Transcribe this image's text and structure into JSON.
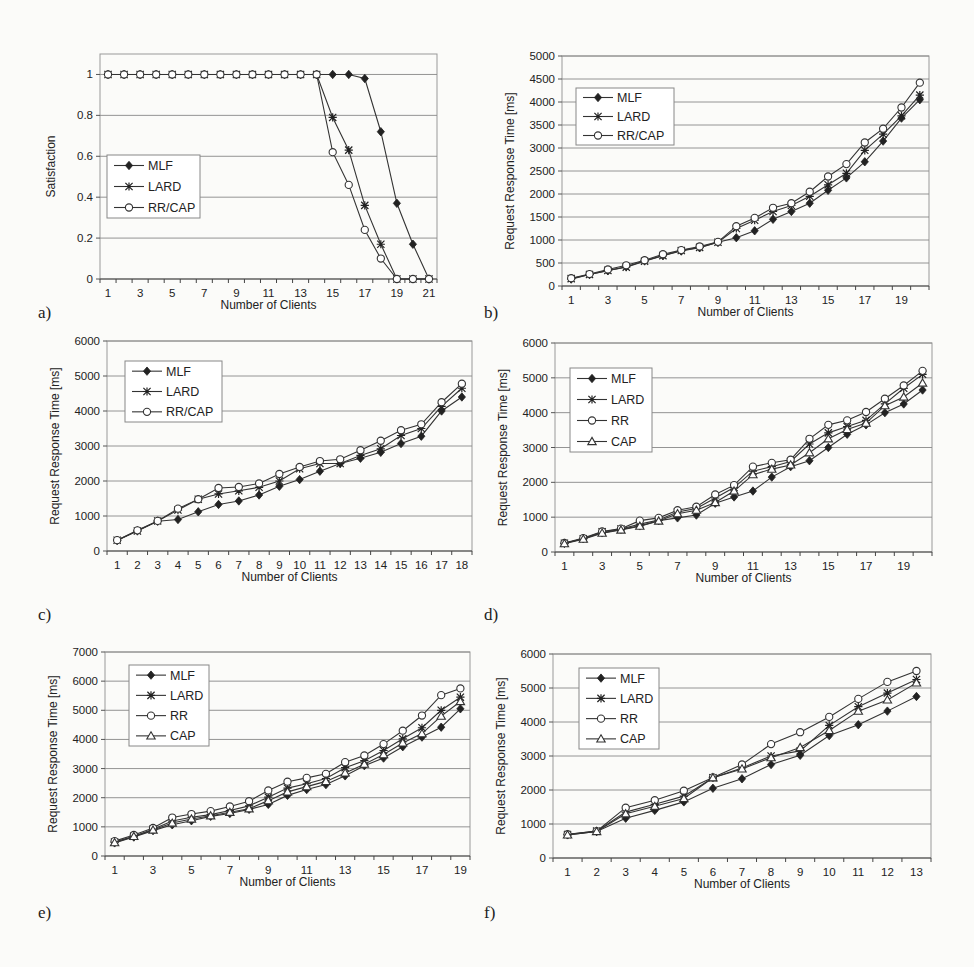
{
  "figure": {
    "panel_labels": [
      "a)",
      "b)",
      "c)",
      "d)",
      "e)",
      "f)"
    ]
  },
  "chart_data": [
    {
      "id": "a",
      "type": "line",
      "title": "",
      "xlabel": "Number of Clients",
      "ylabel": "Satisfaction",
      "x": [
        1,
        2,
        3,
        4,
        5,
        6,
        7,
        8,
        9,
        10,
        11,
        12,
        13,
        14,
        15,
        16,
        17,
        18,
        19,
        20,
        21
      ],
      "xticks": [
        "1",
        "3",
        "5",
        "7",
        "9",
        "11",
        "13",
        "15",
        "17",
        "19",
        "21"
      ],
      "ylim": [
        0,
        1.1
      ],
      "yticks": [
        "0",
        "0.2",
        "0.4",
        "0.6",
        "0.8",
        "1"
      ],
      "ytick_values": [
        0,
        0.2,
        0.4,
        0.6,
        0.8,
        1
      ],
      "grid": true,
      "legend": "center-left",
      "series": [
        {
          "name": "MLF",
          "marker": "diamond",
          "values": [
            1,
            1,
            1,
            1,
            1,
            1,
            1,
            1,
            1,
            1,
            1,
            1,
            1,
            1,
            1,
            1,
            0.98,
            0.72,
            0.37,
            0.17,
            0
          ]
        },
        {
          "name": "LARD",
          "marker": "asterisk",
          "values": [
            1,
            1,
            1,
            1,
            1,
            1,
            1,
            1,
            1,
            1,
            1,
            1,
            1,
            1,
            0.79,
            0.63,
            0.36,
            0.17,
            0,
            0,
            0
          ]
        },
        {
          "name": "RR/CAP",
          "marker": "circle",
          "values": [
            1,
            1,
            1,
            1,
            1,
            1,
            1,
            1,
            1,
            1,
            1,
            1,
            1,
            1,
            0.62,
            0.46,
            0.24,
            0.1,
            0,
            0,
            0
          ]
        }
      ]
    },
    {
      "id": "b",
      "type": "line",
      "title": "",
      "xlabel": "Number of Clients",
      "ylabel": "Request Response Time [ms]",
      "x": [
        1,
        2,
        3,
        4,
        5,
        6,
        7,
        8,
        9,
        10,
        11,
        12,
        13,
        14,
        15,
        16,
        17,
        18,
        19,
        20
      ],
      "xticks": [
        "1",
        "3",
        "5",
        "7",
        "9",
        "11",
        "13",
        "15",
        "17",
        "19"
      ],
      "ylim": [
        0,
        5000
      ],
      "yticks": [
        "0",
        "500",
        "1000",
        "1500",
        "2000",
        "2500",
        "3000",
        "3500",
        "4000",
        "4500",
        "5000"
      ],
      "ytick_values": [
        0,
        500,
        1000,
        1500,
        2000,
        2500,
        3000,
        3500,
        4000,
        4500,
        5000
      ],
      "grid": true,
      "legend": "top-left",
      "series": [
        {
          "name": "MLF",
          "marker": "diamond",
          "values": [
            150,
            250,
            330,
            420,
            550,
            660,
            760,
            830,
            950,
            1050,
            1200,
            1450,
            1620,
            1800,
            2080,
            2350,
            2700,
            3150,
            3650,
            4050
          ]
        },
        {
          "name": "LARD",
          "marker": "asterisk",
          "values": [
            160,
            250,
            340,
            410,
            540,
            660,
            770,
            840,
            950,
            1250,
            1430,
            1620,
            1750,
            1950,
            2200,
            2450,
            2950,
            3300,
            3700,
            4150
          ]
        },
        {
          "name": "RR/CAP",
          "marker": "circle",
          "values": [
            170,
            260,
            360,
            450,
            560,
            690,
            780,
            860,
            960,
            1300,
            1480,
            1700,
            1800,
            2050,
            2380,
            2650,
            3120,
            3420,
            3880,
            4420
          ]
        }
      ]
    },
    {
      "id": "c",
      "type": "line",
      "title": "",
      "xlabel": "Number of Clients",
      "ylabel": "Request Response Time [ms]",
      "x": [
        1,
        2,
        3,
        4,
        5,
        6,
        7,
        8,
        9,
        10,
        11,
        12,
        13,
        14,
        15,
        16,
        17,
        18
      ],
      "xticks": [
        "1",
        "2",
        "3",
        "4",
        "5",
        "6",
        "7",
        "8",
        "9",
        "10",
        "11",
        "12",
        "13",
        "14",
        "15",
        "16",
        "17",
        "18"
      ],
      "ylim": [
        0,
        6000
      ],
      "yticks": [
        "0",
        "1000",
        "2000",
        "3000",
        "4000",
        "5000",
        "6000"
      ],
      "ytick_values": [
        0,
        1000,
        2000,
        3000,
        4000,
        5000,
        6000
      ],
      "grid": true,
      "legend": "top-left",
      "series": [
        {
          "name": "MLF",
          "marker": "diamond",
          "values": [
            300,
            580,
            850,
            900,
            1120,
            1330,
            1430,
            1600,
            1850,
            2040,
            2280,
            2500,
            2650,
            2820,
            3070,
            3280,
            4000,
            4400
          ]
        },
        {
          "name": "LARD",
          "marker": "asterisk",
          "values": [
            310,
            570,
            860,
            1170,
            1480,
            1630,
            1720,
            1820,
            2000,
            2350,
            2500,
            2500,
            2730,
            2920,
            3300,
            3500,
            4130,
            4650
          ]
        },
        {
          "name": "RR/CAP",
          "marker": "circle",
          "values": [
            310,
            590,
            860,
            1210,
            1480,
            1800,
            1830,
            1930,
            2200,
            2400,
            2570,
            2620,
            2880,
            3150,
            3450,
            3620,
            4250,
            4780
          ]
        }
      ]
    },
    {
      "id": "d",
      "type": "line",
      "title": "",
      "xlabel": "Number of Clients",
      "ylabel": "Request Response Time [ms]",
      "x": [
        1,
        2,
        3,
        4,
        5,
        6,
        7,
        8,
        9,
        10,
        11,
        12,
        13,
        14,
        15,
        16,
        17,
        18,
        19,
        20
      ],
      "xticks": [
        "1",
        "3",
        "5",
        "7",
        "9",
        "11",
        "13",
        "15",
        "17",
        "19"
      ],
      "ylim": [
        0,
        6000
      ],
      "yticks": [
        "0",
        "1000",
        "2000",
        "3000",
        "4000",
        "5000",
        "6000"
      ],
      "ytick_values": [
        0,
        1000,
        2000,
        3000,
        4000,
        5000,
        6000
      ],
      "grid": true,
      "legend": "top-left",
      "series": [
        {
          "name": "MLF",
          "marker": "diamond",
          "values": [
            250,
            380,
            550,
            650,
            750,
            900,
            980,
            1060,
            1400,
            1580,
            1750,
            2150,
            2450,
            2620,
            3000,
            3380,
            3650,
            4000,
            4250,
            4650
          ]
        },
        {
          "name": "LARD",
          "marker": "asterisk",
          "values": [
            250,
            380,
            580,
            660,
            800,
            920,
            1150,
            1250,
            1550,
            1850,
            2320,
            2450,
            2600,
            3100,
            3420,
            3600,
            3780,
            4250,
            4700,
            5100
          ]
        },
        {
          "name": "RR",
          "marker": "circle",
          "values": [
            260,
            400,
            590,
            670,
            900,
            980,
            1200,
            1300,
            1650,
            1920,
            2450,
            2560,
            2650,
            3250,
            3650,
            3780,
            4020,
            4400,
            4780,
            5200
          ]
        },
        {
          "name": "CAP",
          "marker": "triangle",
          "values": [
            240,
            370,
            540,
            630,
            740,
            890,
            1100,
            1200,
            1420,
            1750,
            2220,
            2380,
            2500,
            2850,
            3250,
            3520,
            3700,
            4200,
            4450,
            4850
          ]
        }
      ]
    },
    {
      "id": "e",
      "type": "line",
      "title": "",
      "xlabel": "Number of Clients",
      "ylabel": "Request Response Time [ms]",
      "x": [
        1,
        2,
        3,
        4,
        5,
        6,
        7,
        8,
        9,
        10,
        11,
        12,
        13,
        14,
        15,
        16,
        17,
        18,
        19
      ],
      "xticks": [
        "1",
        "3",
        "5",
        "7",
        "9",
        "11",
        "13",
        "15",
        "17",
        "19"
      ],
      "ylim": [
        0,
        7000
      ],
      "yticks": [
        "0",
        "1000",
        "2000",
        "3000",
        "4000",
        "5000",
        "6000",
        "7000"
      ],
      "ytick_values": [
        0,
        1000,
        2000,
        3000,
        4000,
        5000,
        6000,
        7000
      ],
      "grid": true,
      "legend": "top-left",
      "series": [
        {
          "name": "MLF",
          "marker": "diamond",
          "values": [
            450,
            650,
            870,
            1070,
            1210,
            1360,
            1460,
            1600,
            1770,
            2080,
            2280,
            2450,
            2750,
            3100,
            3360,
            3750,
            4080,
            4420,
            5050
          ]
        },
        {
          "name": "LARD",
          "marker": "asterisk",
          "values": [
            480,
            680,
            920,
            1200,
            1330,
            1420,
            1560,
            1720,
            2020,
            2330,
            2480,
            2660,
            3030,
            3270,
            3620,
            4020,
            4400,
            5000,
            5450
          ]
        },
        {
          "name": "RR",
          "marker": "circle",
          "values": [
            510,
            720,
            960,
            1320,
            1440,
            1540,
            1700,
            1880,
            2250,
            2550,
            2680,
            2820,
            3220,
            3450,
            3840,
            4300,
            4820,
            5520,
            5750
          ]
        },
        {
          "name": "CAP",
          "marker": "triangle",
          "values": [
            460,
            670,
            890,
            1130,
            1270,
            1380,
            1500,
            1620,
            1900,
            2200,
            2380,
            2560,
            2850,
            3150,
            3480,
            3880,
            4200,
            4800,
            5300
          ]
        }
      ]
    },
    {
      "id": "f",
      "type": "line",
      "title": "",
      "xlabel": "Number of Clients",
      "ylabel": "Request Response Time [ms]",
      "x": [
        1,
        2,
        3,
        4,
        5,
        6,
        7,
        8,
        9,
        10,
        11,
        12,
        13
      ],
      "xticks": [
        "1",
        "2",
        "3",
        "4",
        "5",
        "6",
        "7",
        "8",
        "9",
        "10",
        "11",
        "12",
        "13"
      ],
      "ylim": [
        0,
        6000
      ],
      "yticks": [
        "0",
        "1000",
        "2000",
        "3000",
        "4000",
        "5000",
        "6000"
      ],
      "ytick_values": [
        0,
        1000,
        2000,
        3000,
        4000,
        5000,
        6000
      ],
      "grid": true,
      "legend": "top-left",
      "series": [
        {
          "name": "MLF",
          "marker": "diamond",
          "values": [
            680,
            780,
            1170,
            1400,
            1650,
            2050,
            2330,
            2750,
            3020,
            3600,
            3920,
            4320,
            4750
          ]
        },
        {
          "name": "LARD",
          "marker": "asterisk",
          "values": [
            690,
            790,
            1350,
            1580,
            1820,
            2360,
            2650,
            3000,
            3150,
            3900,
            4450,
            4850,
            5250
          ]
        },
        {
          "name": "RR",
          "marker": "circle",
          "values": [
            700,
            790,
            1480,
            1700,
            1980,
            2370,
            2750,
            3350,
            3700,
            4150,
            4680,
            5180,
            5500
          ]
        },
        {
          "name": "CAP",
          "marker": "triangle",
          "values": [
            680,
            780,
            1300,
            1520,
            1750,
            2360,
            2620,
            2950,
            3250,
            3750,
            4320,
            4650,
            5150
          ]
        }
      ]
    }
  ]
}
